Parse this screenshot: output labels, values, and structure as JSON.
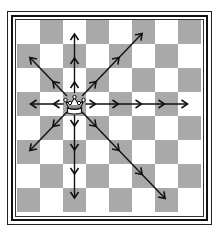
{
  "diagram": {
    "type": "chess-move-diagram",
    "board": {
      "rows": 8,
      "cols": 8,
      "top_left_square": "light",
      "colors": {
        "light": "#ffffff",
        "dark": "#a9a9a9",
        "frame": "#111111",
        "arrow": "#111111"
      }
    },
    "piece": {
      "name": "queen",
      "color": "white",
      "symbol": "♕",
      "row": 3,
      "col": 2
    },
    "moves": [
      {
        "direction": "up",
        "dr": -1,
        "dc": 0,
        "steps": 3
      },
      {
        "direction": "down",
        "dr": 1,
        "dc": 0,
        "steps": 4
      },
      {
        "direction": "left",
        "dr": 0,
        "dc": -1,
        "steps": 2
      },
      {
        "direction": "right",
        "dr": 0,
        "dc": 1,
        "steps": 5
      },
      {
        "direction": "up-left",
        "dr": -1,
        "dc": -1,
        "steps": 2
      },
      {
        "direction": "up-right",
        "dr": -1,
        "dc": 1,
        "steps": 3
      },
      {
        "direction": "down-left",
        "dr": 1,
        "dc": -1,
        "steps": 2
      },
      {
        "direction": "down-right",
        "dr": 1,
        "dc": 1,
        "steps": 4
      }
    ]
  }
}
